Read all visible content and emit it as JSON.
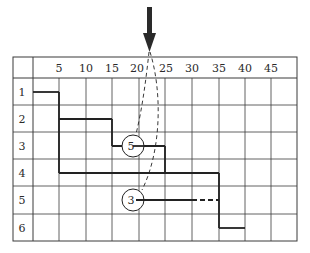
{
  "diagram": {
    "grid": {
      "left": 13,
      "top": 57,
      "right": 297,
      "bottom": 241,
      "label_col_right": 33,
      "header_bottom": 78,
      "col_lines": [
        59,
        86,
        112,
        139,
        165,
        192,
        219,
        245,
        271
      ],
      "row_lines": [
        105,
        132,
        159,
        186,
        214
      ],
      "line_color": "#3a3a3a"
    },
    "column_headers": [
      {
        "label": "5",
        "x": 59
      },
      {
        "label": "10",
        "x": 86
      },
      {
        "label": "15",
        "x": 112
      },
      {
        "label": "20",
        "x": 137
      },
      {
        "label": "25",
        "x": 166
      },
      {
        "label": "30",
        "x": 192
      },
      {
        "label": "35",
        "x": 219
      },
      {
        "label": "40",
        "x": 245
      },
      {
        "label": "45",
        "x": 271
      }
    ],
    "row_headers": [
      {
        "label": "1",
        "y": 92
      },
      {
        "label": "2",
        "y": 119
      },
      {
        "label": "3",
        "y": 146
      },
      {
        "label": "4",
        "y": 173
      },
      {
        "label": "5",
        "y": 200
      },
      {
        "label": "6",
        "y": 228
      }
    ],
    "schedule_path": {
      "points": "33,92 59,92 59,119 112,119 112,146 165,146 165,173 59,173 59,119",
      "color": "#222222"
    },
    "steps": [
      {
        "name": "row-1-bar",
        "d": "M33,92 L59,92"
      },
      {
        "name": "row-1-to-2-drop",
        "d": "M59,92 L59,173"
      },
      {
        "name": "row-2-bar",
        "d": "M59,119 L112,119"
      },
      {
        "name": "row-2-to-3-drop",
        "d": "M112,119 L112,146"
      },
      {
        "name": "row-3-bar",
        "d": "M112,146 L165,146"
      },
      {
        "name": "row-3-to-4-drop",
        "d": "M165,146 L165,173"
      },
      {
        "name": "row-4-bar",
        "d": "M59,173 L219,173"
      },
      {
        "name": "row-4-to-6-drop",
        "d": "M219,173 L219,228"
      },
      {
        "name": "row-6-bar",
        "d": "M219,228 L245,228"
      },
      {
        "name": "row-5-bar",
        "d": "M139,200 L192,200"
      }
    ],
    "dashed_segments": [
      {
        "name": "row-5-dashed-extension",
        "d": "M192,200 L219,200"
      },
      {
        "name": "arrow-to-circle-5-curve",
        "d": "M149,52 C146,80 142,110 136,134"
      },
      {
        "name": "arrow-to-circle-3-curve",
        "d": "M150,52 C162,90 162,150 142,190"
      }
    ],
    "circles": [
      {
        "label": "5",
        "cx": 133,
        "cy": 146,
        "r": 11
      },
      {
        "label": "3",
        "cx": 133,
        "cy": 200,
        "r": 11
      }
    ],
    "arrow": {
      "shaft": {
        "x": 147,
        "y": 7,
        "w": 5,
        "h": 28
      },
      "head": "143,33 156,33 149.5,52",
      "color": "#2a2a2a"
    }
  }
}
